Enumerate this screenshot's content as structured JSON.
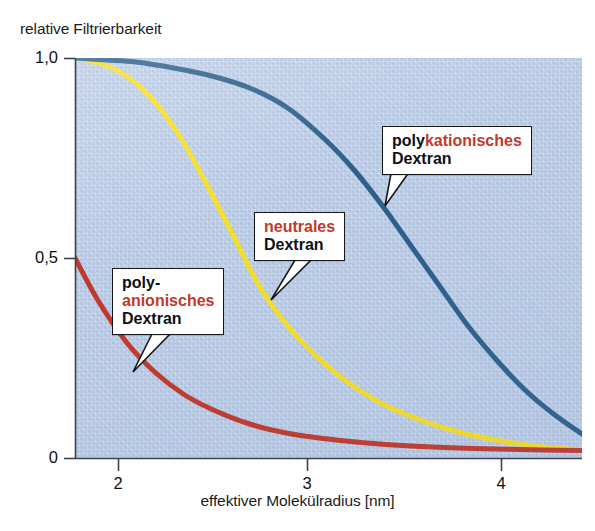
{
  "chart_data": {
    "type": "line",
    "title": "",
    "ylabel": "relative Filtrierbarkeit",
    "xlabel": "effektiver Molekülradius [nm]",
    "xlim": [
      1.78,
      4.45
    ],
    "ylim": [
      0,
      1.0
    ],
    "xticks": [
      2,
      3,
      4
    ],
    "xtick_labels": [
      "2",
      "3",
      "4"
    ],
    "yticks": [
      0,
      0.5,
      1.0
    ],
    "ytick_labels": [
      "0",
      "0,5",
      "1,0"
    ],
    "grid": false,
    "legend_position": "inline-callouts",
    "background_color": "#b6c6e0",
    "series": [
      {
        "name": "polykationisches Dextran",
        "color": "#2d5f8a",
        "x": [
          1.78,
          1.95,
          2.1,
          2.3,
          2.5,
          2.7,
          2.9,
          3.1,
          3.25,
          3.4,
          3.55,
          3.7,
          3.85,
          4.0,
          4.15,
          4.3,
          4.45
        ],
        "values": [
          1.0,
          0.995,
          0.99,
          0.975,
          0.955,
          0.925,
          0.875,
          0.795,
          0.72,
          0.63,
          0.53,
          0.43,
          0.33,
          0.245,
          0.17,
          0.11,
          0.06
        ]
      },
      {
        "name": "neutrales Dextran",
        "color": "#f5de2a",
        "x": [
          1.78,
          1.92,
          2.05,
          2.2,
          2.35,
          2.5,
          2.62,
          2.75,
          2.9,
          3.05,
          3.2,
          3.4,
          3.6,
          3.8,
          4.0,
          4.2,
          4.45
        ],
        "values": [
          1.0,
          0.985,
          0.955,
          0.89,
          0.79,
          0.66,
          0.55,
          0.43,
          0.33,
          0.255,
          0.195,
          0.135,
          0.095,
          0.065,
          0.045,
          0.03,
          0.02
        ]
      },
      {
        "name": "polyanionisches Dextran",
        "color": "#c0392b",
        "x": [
          1.78,
          1.9,
          2.05,
          2.2,
          2.35,
          2.5,
          2.7,
          2.9,
          3.1,
          3.3,
          3.55,
          3.8,
          4.05,
          4.25,
          4.45
        ],
        "values": [
          0.5,
          0.395,
          0.29,
          0.215,
          0.16,
          0.122,
          0.085,
          0.062,
          0.048,
          0.038,
          0.03,
          0.025,
          0.022,
          0.02,
          0.019
        ]
      }
    ],
    "annotations": [
      {
        "id": "polykationisches",
        "lines": [
          {
            "parts": [
              {
                "text": "poly",
                "color": "black"
              },
              {
                "text": "kationisches",
                "color": "red"
              }
            ]
          },
          {
            "parts": [
              {
                "text": "Dextran",
                "color": "black"
              }
            ]
          }
        ],
        "points_to_series": "polykationisches Dextran",
        "points_to_xy": [
          3.38,
          0.63
        ]
      },
      {
        "id": "neutrales",
        "lines": [
          {
            "parts": [
              {
                "text": "neutrales",
                "color": "red"
              }
            ]
          },
          {
            "parts": [
              {
                "text": "Dextran",
                "color": "black"
              }
            ]
          }
        ],
        "points_to_series": "neutrales Dextran",
        "points_to_xy": [
          2.76,
          0.425
        ]
      },
      {
        "id": "polyanionisches",
        "lines": [
          {
            "parts": [
              {
                "text": "poly-",
                "color": "black"
              }
            ]
          },
          {
            "parts": [
              {
                "text": "anionisches",
                "color": "red"
              }
            ]
          },
          {
            "parts": [
              {
                "text": "Dextran",
                "color": "black"
              }
            ]
          }
        ],
        "points_to_series": "polyanionisches Dextran",
        "points_to_xy": [
          2.07,
          0.21
        ]
      }
    ]
  },
  "axis": {
    "y_title": "relative Filtrierbarkeit",
    "x_title": "effektiver Molekülradius [nm]",
    "y_tick_1": "1,0",
    "y_tick_2": "0,5",
    "y_tick_3": "0",
    "x_tick_1": "2",
    "x_tick_2": "3",
    "x_tick_3": "4"
  },
  "callouts": {
    "kat_l1_a": "poly",
    "kat_l1_b": "kationisches",
    "kat_l2": "Dextran",
    "neu_l1": "neutrales",
    "neu_l2": "Dextran",
    "ani_l1": "poly-",
    "ani_l2": "anionisches",
    "ani_l3": "Dextran"
  },
  "colors": {
    "series_blue": "#2d5f8a",
    "series_yellow": "#f5de2a",
    "series_red": "#c0392b",
    "plot_background": "#b6c6e0",
    "accent_red_text": "#c0392b"
  }
}
